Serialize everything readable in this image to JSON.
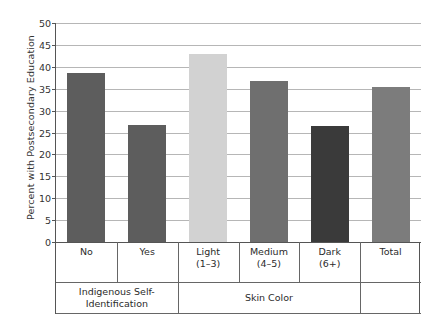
{
  "chart_data": {
    "type": "bar",
    "title": "",
    "xlabel": "",
    "ylabel": "Percent with Postsecondary Education",
    "ylim": [
      0,
      50
    ],
    "ytick_step": 5,
    "yticks": [
      "0",
      "5",
      "10",
      "15",
      "20",
      "25",
      "30",
      "35",
      "40",
      "45",
      "50"
    ],
    "grid": true,
    "legend": "none",
    "categories": [
      "No",
      "Yes",
      "Light",
      "Medium",
      "Dark",
      "Total"
    ],
    "category_sublabels": [
      "",
      "",
      "(1–3)",
      "(4–5)",
      "(6+)",
      ""
    ],
    "values": [
      38.5,
      26.8,
      42.9,
      36.7,
      26.4,
      35.3
    ],
    "bar_colors": [
      "#5d5d5d",
      "#5d5d5d",
      "#d2d2d2",
      "#6f6f6f",
      "#3a3a3a",
      "#7c7c7c"
    ],
    "groups": [
      {
        "label": "Indigenous Self-Identification",
        "categories": [
          "No",
          "Yes"
        ]
      },
      {
        "label": "Skin Color",
        "categories": [
          "Light",
          "Medium",
          "Dark"
        ]
      },
      {
        "label": "",
        "categories": [
          "Total"
        ]
      }
    ]
  },
  "axis": {
    "y_title": "Percent with Postsecondary Education",
    "group_labels": [
      "Indigenous Self-Identification",
      "Skin Color",
      ""
    ]
  }
}
